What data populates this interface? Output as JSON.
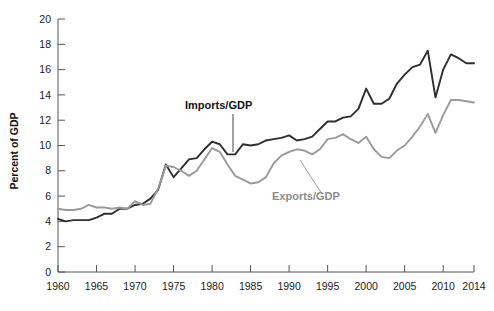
{
  "chart_data": {
    "type": "line",
    "title": "",
    "subtitle": "",
    "xlabel": "",
    "ylabel": "Percent of GDP",
    "xlim": [
      1960,
      2014
    ],
    "ylim": [
      0,
      20
    ],
    "grid": false,
    "legend_position": "inline-annotations",
    "x_ticks": [
      "1960",
      "1965",
      "1970",
      "1975",
      "1980",
      "1985",
      "1990",
      "1995",
      "2000",
      "2005",
      "2010",
      "2014"
    ],
    "x_tick_values": [
      1960,
      1965,
      1970,
      1975,
      1980,
      1985,
      1990,
      1995,
      2000,
      2005,
      2010,
      2014
    ],
    "y_ticks": [
      "0",
      "2",
      "4",
      "6",
      "8",
      "10",
      "12",
      "14",
      "16",
      "18",
      "20"
    ],
    "y_tick_values": [
      0,
      2,
      4,
      6,
      8,
      10,
      12,
      14,
      16,
      18,
      20
    ],
    "x": [
      1960,
      1961,
      1962,
      1963,
      1964,
      1965,
      1966,
      1967,
      1968,
      1969,
      1970,
      1971,
      1972,
      1973,
      1974,
      1975,
      1976,
      1977,
      1978,
      1979,
      1980,
      1981,
      1982,
      1983,
      1984,
      1985,
      1986,
      1987,
      1988,
      1989,
      1990,
      1991,
      1992,
      1993,
      1994,
      1995,
      1996,
      1997,
      1998,
      1999,
      2000,
      2001,
      2002,
      2003,
      2004,
      2005,
      2006,
      2007,
      2008,
      2009,
      2010,
      2011,
      2012,
      2013,
      2014
    ],
    "series": [
      {
        "name": "Imports/GDP",
        "color": "#2e2e2e",
        "values": [
          4.2,
          4.0,
          4.1,
          4.1,
          4.1,
          4.3,
          4.6,
          4.6,
          5.0,
          5.0,
          5.3,
          5.4,
          5.8,
          6.5,
          8.5,
          7.5,
          8.2,
          8.9,
          9.0,
          9.7,
          10.3,
          10.1,
          9.3,
          9.3,
          10.1,
          10.0,
          10.1,
          10.4,
          10.5,
          10.6,
          10.8,
          10.4,
          10.5,
          10.7,
          11.3,
          11.9,
          11.9,
          12.2,
          12.3,
          12.9,
          14.5,
          13.3,
          13.3,
          13.7,
          14.9,
          15.6,
          16.2,
          16.4,
          17.5,
          13.8,
          16.0,
          17.2,
          16.9,
          16.5,
          16.5
        ]
      },
      {
        "name": "Exports/GDP",
        "color": "#9a9a9a",
        "values": [
          5.0,
          4.9,
          4.9,
          5.0,
          5.3,
          5.1,
          5.1,
          5.0,
          5.1,
          5.0,
          5.6,
          5.3,
          5.4,
          6.6,
          8.4,
          8.3,
          8.0,
          7.6,
          8.0,
          8.9,
          9.8,
          9.5,
          8.5,
          7.6,
          7.3,
          7.0,
          7.1,
          7.5,
          8.6,
          9.2,
          9.5,
          9.7,
          9.6,
          9.3,
          9.7,
          10.5,
          10.6,
          10.9,
          10.5,
          10.2,
          10.7,
          9.7,
          9.1,
          9.0,
          9.6,
          10.0,
          10.7,
          11.5,
          12.5,
          11.0,
          12.4,
          13.6,
          13.6,
          13.5,
          13.4
        ]
      }
    ],
    "annotations": [
      {
        "text": "Imports/GDP",
        "style": "dark",
        "label_x": 185,
        "label_y": 109,
        "leader": {
          "x1": 233,
          "y1": 114,
          "x2": 233,
          "y2": 152
        }
      },
      {
        "text": "Exports/GDP",
        "style": "muted",
        "label_x": 272,
        "label_y": 200,
        "leader": {
          "x1": 322,
          "y1": 194,
          "x2": 300,
          "y2": 160
        }
      }
    ],
    "axis_color": "#555555",
    "background": "#ffffff"
  }
}
